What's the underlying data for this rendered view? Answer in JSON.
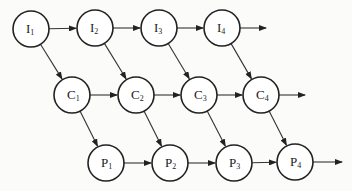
{
  "diagram": {
    "title": "",
    "node_radius": 18,
    "nodes": [
      {
        "id": "I1",
        "letter": "I",
        "sub": "1",
        "x": 31,
        "y": 29
      },
      {
        "id": "I2",
        "letter": "I",
        "sub": "2",
        "x": 95,
        "y": 28
      },
      {
        "id": "I3",
        "letter": "I",
        "sub": "3",
        "x": 159,
        "y": 28
      },
      {
        "id": "I4",
        "letter": "I",
        "sub": "4",
        "x": 222,
        "y": 28
      },
      {
        "id": "C1",
        "letter": "C",
        "sub": "1",
        "x": 72,
        "y": 95
      },
      {
        "id": "C2",
        "letter": "C",
        "sub": "2",
        "x": 136,
        "y": 95
      },
      {
        "id": "C3",
        "letter": "C",
        "sub": "3",
        "x": 199,
        "y": 95
      },
      {
        "id": "C4",
        "letter": "C",
        "sub": "4",
        "x": 261,
        "y": 95
      },
      {
        "id": "P1",
        "letter": "P",
        "sub": "1",
        "x": 106,
        "y": 163
      },
      {
        "id": "P2",
        "letter": "P",
        "sub": "2",
        "x": 170,
        "y": 163
      },
      {
        "id": "P3",
        "letter": "P",
        "sub": "3",
        "x": 234,
        "y": 163
      },
      {
        "id": "P4",
        "letter": "P",
        "sub": "4",
        "x": 295,
        "y": 162
      }
    ],
    "edges": [
      {
        "from": "I1",
        "to": "I2"
      },
      {
        "from": "I2",
        "to": "I3"
      },
      {
        "from": "I3",
        "to": "I4"
      },
      {
        "from": "I4",
        "to_point": [
          266,
          28
        ]
      },
      {
        "from": "C1",
        "to": "C2"
      },
      {
        "from": "C2",
        "to": "C3"
      },
      {
        "from": "C3",
        "to": "C4"
      },
      {
        "from": "C4",
        "to_point": [
          305,
          95
        ]
      },
      {
        "from": "P1",
        "to": "P2"
      },
      {
        "from": "P2",
        "to": "P3"
      },
      {
        "from": "P3",
        "to": "P4"
      },
      {
        "from": "P4",
        "to_point": [
          342,
          162
        ]
      },
      {
        "from": "I1",
        "to": "C1"
      },
      {
        "from": "I2",
        "to": "C2"
      },
      {
        "from": "I3",
        "to": "C3"
      },
      {
        "from": "I4",
        "to": "C4"
      },
      {
        "from": "C1",
        "to": "P1"
      },
      {
        "from": "C2",
        "to": "P2"
      },
      {
        "from": "C3",
        "to": "P3"
      },
      {
        "from": "C4",
        "to": "P4"
      }
    ],
    "colors": {
      "stroke": "#222222",
      "background": "#fbfbfa",
      "node_fill": "#ffffff"
    }
  }
}
